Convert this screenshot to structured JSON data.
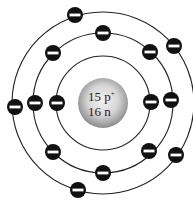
{
  "diagram": {
    "nucleus": {
      "center": [
        103,
        103
      ],
      "radius": 25,
      "protons_label": "15 p",
      "protons_sup": "+",
      "neutrons_label": "16 n",
      "colors": {
        "fill_center": "#eeeeee",
        "fill_edge": "#8a8a8a"
      }
    },
    "shells": [
      {
        "name": "inner",
        "radius": 47,
        "electron_count": 2
      },
      {
        "name": "middle",
        "radius": 70,
        "electron_count": 8
      },
      {
        "name": "outer",
        "radius": 91,
        "electron_count": 5
      }
    ],
    "electrons": [
      {
        "shell": "inner",
        "x": 57,
        "y": 103
      },
      {
        "shell": "inner",
        "x": 151,
        "y": 102
      },
      {
        "shell": "middle",
        "x": 103,
        "y": 33
      },
      {
        "shell": "middle",
        "x": 53,
        "y": 53
      },
      {
        "shell": "middle",
        "x": 150,
        "y": 52
      },
      {
        "shell": "middle",
        "x": 35,
        "y": 103
      },
      {
        "shell": "middle",
        "x": 171,
        "y": 100
      },
      {
        "shell": "middle",
        "x": 53,
        "y": 152
      },
      {
        "shell": "middle",
        "x": 103,
        "y": 173
      },
      {
        "shell": "middle",
        "x": 149,
        "y": 151
      },
      {
        "shell": "outer",
        "x": 75,
        "y": 15
      },
      {
        "shell": "outer",
        "x": 174,
        "y": 46
      },
      {
        "shell": "outer",
        "x": 15,
        "y": 107
      },
      {
        "shell": "outer",
        "x": 176,
        "y": 155
      },
      {
        "shell": "outer",
        "x": 78,
        "y": 190
      }
    ],
    "electron_style": {
      "radius": 8,
      "fill": "#111111",
      "bar_color": "#ffffff",
      "symbol": "minus"
    },
    "orbit_color": "#222222"
  }
}
